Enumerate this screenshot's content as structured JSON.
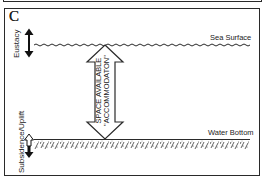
{
  "figure": {
    "panel_letter": "C",
    "labels": {
      "sea_surface": "Sea Surface",
      "water_bottom": "Water Bottom",
      "eustacy": "Eustacy",
      "subsidence_uplift": "Subsidence/Uplift",
      "accommodation_line1": "SPACE AVAILABLE",
      "accommodation_line2": "\"ACCOMMODATON\""
    },
    "colors": {
      "line": "#2a2a2a",
      "background": "#ffffff"
    }
  }
}
